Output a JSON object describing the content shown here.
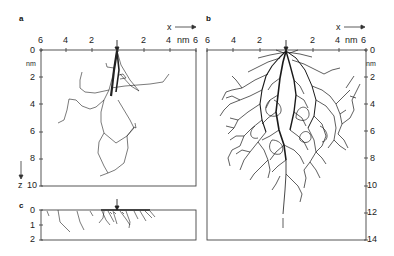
{
  "figure": {
    "panels": [
      {
        "id": "a",
        "letter": "a",
        "x_axis": {
          "label": "x",
          "unit": "nm",
          "ticks": [
            "6",
            "4",
            "2",
            "",
            "2",
            "4",
            "6"
          ]
        },
        "z_axis": {
          "label": "z",
          "unit": "nm",
          "ticks": [
            "0",
            "2",
            "4",
            "6",
            "8",
            "10"
          ]
        },
        "range": {
          "x": [
            -6,
            6
          ],
          "z": [
            0,
            10
          ]
        }
      },
      {
        "id": "b",
        "letter": "b",
        "x_axis": {
          "label": "x",
          "unit": "nm",
          "ticks": [
            "6",
            "4",
            "2",
            "",
            "2",
            "4",
            "6"
          ]
        },
        "z_axis": {
          "label": "z",
          "unit": "nm",
          "ticks": [
            "0",
            "2",
            "4",
            "6",
            "8",
            "10",
            "12",
            "14"
          ]
        },
        "range": {
          "x": [
            -6,
            6
          ],
          "z": [
            0,
            14
          ]
        }
      },
      {
        "id": "c",
        "letter": "c",
        "z_axis": {
          "ticks": [
            "0",
            "1",
            "2"
          ]
        },
        "range": {
          "z": [
            0,
            2
          ]
        }
      }
    ],
    "annotations": {
      "x_arrow_label": "x",
      "z_arrow_label": "z",
      "unit": "nm",
      "incidence_marker": "down-arrow"
    },
    "colors": {
      "ink": "#1a1a1a",
      "axis": "#444444",
      "background": "#ffffff"
    }
  }
}
